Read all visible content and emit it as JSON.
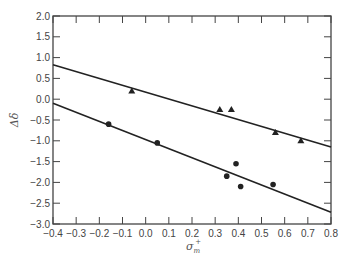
{
  "chart_data": {
    "type": "scatter",
    "title": "",
    "xlabel": "σ⁺ₘ",
    "xlabel_parts": {
      "base": "σ",
      "sup": "+",
      "sub": "m"
    },
    "ylabel": "Δδ",
    "xlim": [
      -0.4,
      0.8
    ],
    "ylim": [
      -3.0,
      2.0
    ],
    "grid": false,
    "legend": null,
    "x_ticks": [
      -0.4,
      -0.3,
      -0.2,
      -0.1,
      0.0,
      0.1,
      0.2,
      0.3,
      0.4,
      0.5,
      0.6,
      0.7,
      0.8
    ],
    "x_tick_labels": [
      "−0.4",
      "−0.3",
      "−0.2",
      "−0.1",
      "0.0",
      "0.1",
      "0.2",
      "0.3",
      "0.4",
      "0.5",
      "0.6",
      "0.7",
      "0.8"
    ],
    "y_ticks": [
      2.0,
      1.5,
      1.0,
      0.5,
      0.0,
      -0.5,
      -1.0,
      -1.5,
      -2.0,
      -2.5,
      -3.0
    ],
    "y_tick_labels": [
      "2.0",
      "1.5",
      "1.0",
      "0.5",
      "0.0",
      "−0.5",
      "−1.0",
      "−1.5",
      "−2.0",
      "−2.5",
      "−3.0"
    ],
    "series": [
      {
        "name": "triangles",
        "marker": "triangle",
        "points": [
          {
            "x": -0.06,
            "y": 0.2
          },
          {
            "x": 0.32,
            "y": -0.25
          },
          {
            "x": 0.37,
            "y": -0.25
          },
          {
            "x": 0.56,
            "y": -0.8
          },
          {
            "x": 0.67,
            "y": -1.0
          }
        ],
        "fit_line": {
          "x0": -0.4,
          "y0": 0.83,
          "x1": 0.8,
          "y1": -1.15
        }
      },
      {
        "name": "circles",
        "marker": "circle",
        "points": [
          {
            "x": -0.16,
            "y": -0.6
          },
          {
            "x": 0.05,
            "y": -1.05
          },
          {
            "x": 0.35,
            "y": -1.85
          },
          {
            "x": 0.39,
            "y": -1.55
          },
          {
            "x": 0.41,
            "y": -2.1
          },
          {
            "x": 0.55,
            "y": -2.05
          }
        ],
        "fit_line": {
          "x0": -0.4,
          "y0": -0.1,
          "x1": 0.8,
          "y1": -2.72
        }
      }
    ]
  },
  "colors": {
    "axis": "#444444",
    "line": "#222222",
    "marker": "#222222",
    "text": "#444444"
  }
}
